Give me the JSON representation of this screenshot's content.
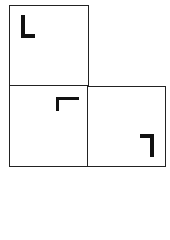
{
  "diagram": {
    "cells": [
      {
        "id": "top-left",
        "glyph": "corner-bottom-left",
        "position": "top-left"
      },
      {
        "id": "bottom-left",
        "glyph": "corner-top-left",
        "position": "top-right"
      },
      {
        "id": "bottom-right",
        "glyph": "corner-top-right",
        "position": "bottom-right"
      }
    ],
    "colors": {
      "line": "#222222",
      "glyph": "#111111",
      "background": "#ffffff"
    }
  }
}
